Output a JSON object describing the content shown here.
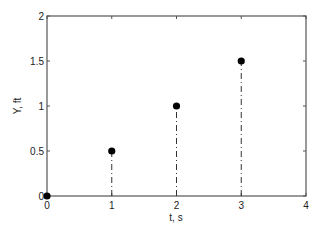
{
  "chart_data": {
    "type": "stem",
    "title": "",
    "xlabel": "t, s",
    "ylabel": "Y, ft",
    "xlim": [
      0,
      4
    ],
    "ylim": [
      0,
      2
    ],
    "xticks": [
      0,
      1,
      2,
      3,
      4
    ],
    "xtick_labels": [
      "0",
      "1",
      "2",
      "3",
      "4"
    ],
    "yticks": [
      0,
      0.5,
      1,
      1.5,
      2
    ],
    "ytick_labels": [
      "0",
      "0.5",
      "1",
      "1.5",
      "2"
    ],
    "grid": false,
    "legend": null,
    "series": [
      {
        "name": "Y",
        "x": [
          0,
          1,
          2,
          3
        ],
        "y": [
          0,
          0.5,
          1,
          1.5
        ],
        "marker": "filled-circle",
        "stem_style": "dash-dot"
      }
    ]
  },
  "colors": {
    "axis": "#555555",
    "marker": "#000000",
    "stem": "#333333"
  }
}
